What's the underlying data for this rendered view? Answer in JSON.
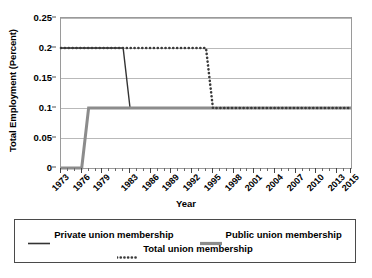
{
  "chart_data": {
    "type": "line",
    "title": "",
    "xlabel": "Year",
    "ylabel": "Total Employment (Percent)",
    "xlim": [
      1973,
      2015
    ],
    "ylim": [
      0,
      0.25
    ],
    "grid": true,
    "legend_position": "bottom",
    "y_ticks": [
      "0",
      "0.05",
      "0.1",
      "0.15",
      "0.2",
      "0.25"
    ],
    "y_tick_values": [
      0,
      0.05,
      0.1,
      0.15,
      0.2,
      0.25
    ],
    "x_ticks": [
      "1973",
      "1976",
      "1979",
      "1983",
      "1986",
      "1989",
      "1992",
      "1995",
      "1998",
      "2001",
      "2004",
      "2007",
      "2010",
      "2013",
      "2015"
    ],
    "x_tick_values": [
      1973,
      1976,
      1979,
      1983,
      1986,
      1989,
      1992,
      1995,
      1998,
      2001,
      2004,
      2007,
      2010,
      2013,
      2015
    ],
    "x": [
      1973,
      1974,
      1975,
      1976,
      1977,
      1978,
      1979,
      1980,
      1981,
      1982,
      1983,
      1984,
      1985,
      1986,
      1987,
      1988,
      1989,
      1990,
      1991,
      1992,
      1993,
      1994,
      1995,
      1996,
      1997,
      1998,
      1999,
      2000,
      2001,
      2002,
      2003,
      2004,
      2005,
      2006,
      2007,
      2008,
      2009,
      2010,
      2011,
      2012,
      2013,
      2014,
      2015
    ],
    "series": [
      {
        "name": "Private union membership",
        "style": "solid",
        "color": "#333333",
        "width": 1.4,
        "values": [
          0.2,
          0.2,
          0.2,
          0.2,
          0.2,
          0.2,
          0.2,
          0.2,
          0.2,
          0.2,
          0.1,
          0.1,
          0.1,
          0.1,
          0.1,
          0.1,
          0.1,
          0.1,
          0.1,
          0.1,
          0.1,
          0.1,
          0.1,
          0.1,
          0.1,
          0.1,
          0.1,
          0.1,
          0.1,
          0.1,
          0.1,
          0.1,
          0.1,
          0.1,
          0.1,
          0.1,
          0.1,
          0.1,
          0.1,
          0.1,
          0.1,
          0.1,
          0.1
        ]
      },
      {
        "name": "Public union membership",
        "style": "solid",
        "color": "#8c8c8c",
        "width": 3.0,
        "values": [
          0.0,
          0.0,
          0.0,
          0.0,
          0.1,
          0.1,
          0.1,
          0.1,
          0.1,
          0.1,
          0.1,
          0.1,
          0.1,
          0.1,
          0.1,
          0.1,
          0.1,
          0.1,
          0.1,
          0.1,
          0.1,
          0.1,
          0.1,
          0.1,
          0.1,
          0.1,
          0.1,
          0.1,
          0.1,
          0.1,
          0.1,
          0.1,
          0.1,
          0.1,
          0.1,
          0.1,
          0.1,
          0.1,
          0.1,
          0.1,
          0.1,
          0.1,
          0.1
        ]
      },
      {
        "name": "Total union membership",
        "style": "dotted",
        "color": "#3a3a3a",
        "width": 2.6,
        "values": [
          0.2,
          0.2,
          0.2,
          0.2,
          0.2,
          0.2,
          0.2,
          0.2,
          0.2,
          0.2,
          0.2,
          0.2,
          0.2,
          0.2,
          0.2,
          0.2,
          0.2,
          0.2,
          0.2,
          0.2,
          0.2,
          0.2,
          0.1,
          0.1,
          0.1,
          0.1,
          0.1,
          0.1,
          0.1,
          0.1,
          0.1,
          0.1,
          0.1,
          0.1,
          0.1,
          0.1,
          0.1,
          0.1,
          0.1,
          0.1,
          0.1,
          0.1,
          0.1
        ]
      }
    ]
  },
  "legend": {
    "rows": [
      [
        {
          "label": "Private union membership",
          "swatch": "solid-dark-thin"
        },
        {
          "label": "Public union membership",
          "swatch": "solid-gray-thick"
        }
      ],
      [
        {
          "label": "Total union membership",
          "swatch": "dotted-dark"
        }
      ]
    ]
  },
  "colors": {
    "private": "#333333",
    "public": "#8c8c8c",
    "total": "#3a3a3a",
    "grid": "#b9b9b9",
    "frame": "#9a9a9a",
    "background": "#ffffff"
  }
}
